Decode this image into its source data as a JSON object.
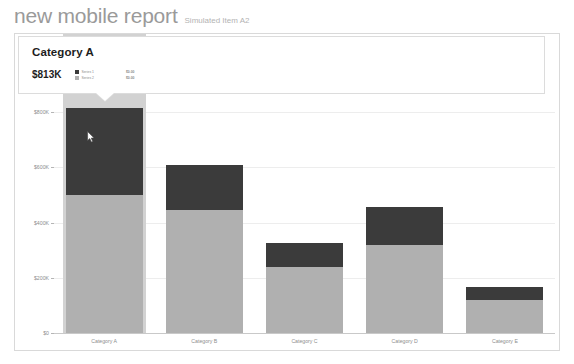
{
  "header": {
    "title": "new mobile report",
    "subtitle": "Simulated Item A2"
  },
  "tooltip": {
    "title": "Category A",
    "value": "$813K",
    "legend": [
      {
        "label": "Series 1",
        "color": "#3b3b3b"
      },
      {
        "label": "Series 2",
        "color": "#b0b0b0"
      }
    ],
    "aux": [
      {
        "label": "$0.00"
      },
      {
        "label": "$0.00"
      }
    ]
  },
  "chart_data": {
    "type": "bar",
    "title": "",
    "xlabel": "",
    "ylabel": "",
    "stacked": true,
    "grid": true,
    "legend_position": "top-left",
    "ylim": [
      0,
      900
    ],
    "yticks": [
      0,
      200,
      400,
      600,
      800
    ],
    "ytick_labels": [
      "$0",
      "$200K",
      "$400K",
      "$600K",
      "$800K"
    ],
    "categories": [
      "Category A",
      "Category B",
      "Category C",
      "Category D",
      "Category E"
    ],
    "series": [
      {
        "name": "Series 2",
        "color": "#b0b0b0",
        "values": [
          500,
          445,
          240,
          320,
          120
        ]
      },
      {
        "name": "Series 1",
        "color": "#3b3b3b",
        "values": [
          313,
          165,
          85,
          135,
          45
        ]
      }
    ],
    "totals": [
      813,
      610,
      325,
      455,
      165
    ],
    "selected_category": "Category A",
    "selection_color": "#d2d2d2"
  }
}
